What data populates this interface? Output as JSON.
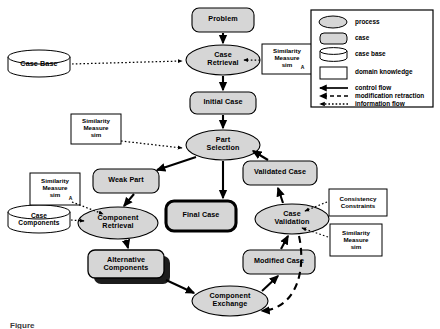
{
  "diagram": {
    "colors": {
      "process_fill": "#d8d8d8",
      "case_fill": "#d0d0d0",
      "casebase_fill": "#ffffff",
      "domain_fill": "#ffffff",
      "stroke": "#000000",
      "shadow": "#1a1a1a",
      "background": "#ffffff"
    },
    "nodes": [
      {
        "id": "problem",
        "label": "Problem",
        "type": "case",
        "x": 192,
        "y": 8,
        "w": 62,
        "h": 24
      },
      {
        "id": "case-retrieval",
        "label": "Case\nRetrieval",
        "type": "process",
        "x": 186,
        "y": 45,
        "w": 74,
        "h": 30
      },
      {
        "id": "initial-case",
        "label": "Initial Case",
        "type": "case",
        "x": 190,
        "y": 92,
        "w": 66,
        "h": 22
      },
      {
        "id": "part-selection",
        "label": "Part\nSelection",
        "type": "process",
        "x": 186,
        "y": 130,
        "w": 74,
        "h": 30
      },
      {
        "id": "weak-part",
        "label": "Weak Part",
        "type": "case",
        "x": 93,
        "y": 169,
        "w": 66,
        "h": 24
      },
      {
        "id": "component-retrieval",
        "label": "Component\nRetrieval",
        "type": "process",
        "x": 78,
        "y": 207,
        "w": 80,
        "h": 32
      },
      {
        "id": "alternative-components",
        "label": "Alternative\nComponents",
        "type": "case-shadow",
        "x": 88,
        "y": 250,
        "w": 76,
        "h": 28
      },
      {
        "id": "final-case",
        "label": "Final Case",
        "type": "case-highlight",
        "x": 166,
        "y": 201,
        "w": 70,
        "h": 30
      },
      {
        "id": "component-exchange",
        "label": "Component\nExchange",
        "type": "process",
        "x": 192,
        "y": 286,
        "w": 76,
        "h": 30
      },
      {
        "id": "modified-case",
        "label": "Modified Case",
        "type": "case",
        "x": 243,
        "y": 250,
        "w": 72,
        "h": 24
      },
      {
        "id": "case-validation",
        "label": "Case\nValidation",
        "type": "process",
        "x": 255,
        "y": 204,
        "w": 74,
        "h": 30
      },
      {
        "id": "validated-case",
        "label": "Validated Case",
        "type": "case",
        "x": 243,
        "y": 161,
        "w": 74,
        "h": 24
      }
    ],
    "case_bases": [
      {
        "id": "case-base",
        "label": "Case Base",
        "x": 8,
        "y": 50,
        "w": 62,
        "h": 26
      },
      {
        "id": "case-components",
        "label": "Case\nComponents",
        "x": 8,
        "y": 205,
        "w": 62,
        "h": 28
      }
    ],
    "domain_knowledge": [
      {
        "id": "sim-measure-retrieval",
        "label": "Similarity\nMeasure\nsim",
        "subscript": "A",
        "x": 262,
        "y": 44,
        "w": 50,
        "h": 30
      },
      {
        "id": "sim-measure-part",
        "label": "Similarity\nMeasure\nsim",
        "subscript": "",
        "x": 71,
        "y": 114,
        "w": 50,
        "h": 30
      },
      {
        "id": "sim-measure-component",
        "label": "Similarity\nMeasure\nsim",
        "subscript": "A",
        "x": 30,
        "y": 173,
        "w": 50,
        "h": 32
      },
      {
        "id": "consistency-constraints",
        "label": "Consistency\nConstraints",
        "subscript": "",
        "x": 329,
        "y": 189,
        "w": 58,
        "h": 27
      },
      {
        "id": "sim-measure-validation",
        "label": "Similarity\nMeasure\nsim",
        "subscript": "",
        "x": 330,
        "y": 224,
        "w": 52,
        "h": 32
      }
    ],
    "legend": {
      "x": 311,
      "y": 10,
      "w": 122,
      "h": 97,
      "items": [
        {
          "id": "legend-process",
          "label": "process",
          "swatch": "ellipse"
        },
        {
          "id": "legend-case",
          "label": "case",
          "swatch": "rounded"
        },
        {
          "id": "legend-case-base",
          "label": "case base",
          "swatch": "cylinder"
        },
        {
          "id": "legend-domain",
          "label": "domain knowledge",
          "swatch": "rect"
        },
        {
          "id": "legend-control",
          "label": "control flow",
          "swatch": "arrow-solid"
        },
        {
          "id": "legend-modification",
          "label": "modification retraction",
          "swatch": "arrow-dashed"
        },
        {
          "id": "legend-information",
          "label": "information flow",
          "swatch": "arrow-dotted"
        }
      ]
    },
    "caption": "Figure"
  }
}
